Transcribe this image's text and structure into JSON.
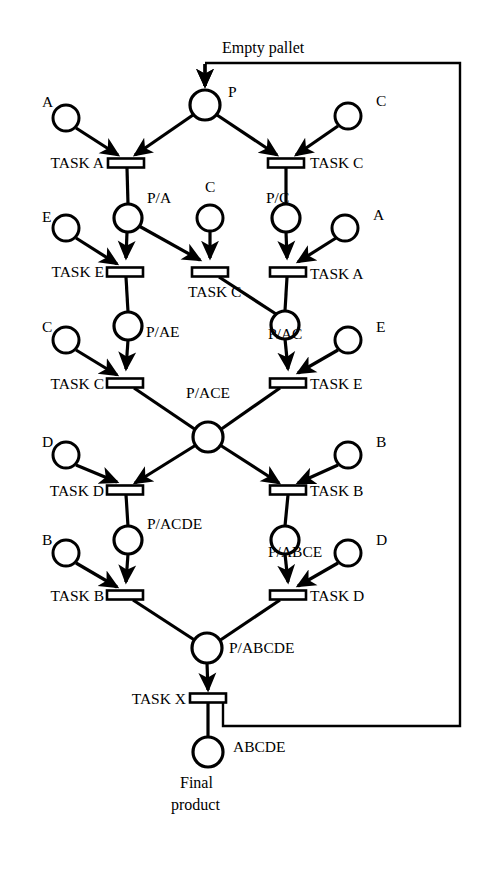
{
  "diagram": {
    "type": "petri-net",
    "canvas": {
      "width": 487,
      "height": 869
    },
    "colors": {
      "stroke": "#000000",
      "fill": "#ffffff",
      "background": "#ffffff"
    },
    "captions": {
      "empty_pallet": "Empty pallet",
      "final_product_line1": "Final",
      "final_product_line2": "product"
    },
    "places": [
      {
        "id": "p",
        "label": "P",
        "cx": 205,
        "cy": 105,
        "r": 15,
        "label_x": 228,
        "label_y": 97,
        "kind": "pallet"
      },
      {
        "id": "res_a_1",
        "label": "A",
        "cx": 66,
        "cy": 118,
        "r": 13,
        "label_x": 42,
        "label_y": 107,
        "kind": "resource"
      },
      {
        "id": "res_c_1",
        "label": "C",
        "cx": 348,
        "cy": 116,
        "r": 13,
        "label_x": 376,
        "label_y": 106,
        "kind": "resource"
      },
      {
        "id": "p_a",
        "label": "P/A",
        "cx": 128,
        "cy": 218,
        "r": 14,
        "label_x": 147,
        "label_y": 203,
        "kind": "pallet"
      },
      {
        "id": "res_c_2",
        "label": "C",
        "cx": 210,
        "cy": 218,
        "r": 13,
        "label_x": 205,
        "label_y": 192,
        "kind": "resource"
      },
      {
        "id": "p_c",
        "label": "P/C",
        "cx": 286,
        "cy": 218,
        "r": 14,
        "label_x": 266,
        "label_y": 203,
        "kind": "pallet"
      },
      {
        "id": "res_a_2",
        "label": "A",
        "cx": 345,
        "cy": 228,
        "r": 13,
        "label_x": 373,
        "label_y": 220,
        "kind": "resource"
      },
      {
        "id": "res_e_1",
        "label": "E",
        "cx": 66,
        "cy": 228,
        "r": 13,
        "label_x": 42,
        "label_y": 222,
        "kind": "resource"
      },
      {
        "id": "p_ae",
        "label": "P/AE",
        "cx": 128,
        "cy": 326,
        "r": 14,
        "label_x": 146,
        "label_y": 337,
        "kind": "pallet"
      },
      {
        "id": "p_ac",
        "label": "P/AC",
        "cx": 285,
        "cy": 325,
        "r": 14,
        "label_x": 268,
        "label_y": 339,
        "kind": "pallet"
      },
      {
        "id": "res_c_3",
        "label": "C",
        "cx": 66,
        "cy": 340,
        "r": 13,
        "label_x": 42,
        "label_y": 332,
        "kind": "resource"
      },
      {
        "id": "res_e_2",
        "label": "E",
        "cx": 348,
        "cy": 340,
        "r": 13,
        "label_x": 376,
        "label_y": 332,
        "kind": "resource"
      },
      {
        "id": "p_ace",
        "label": "P/ACE",
        "cx": 208,
        "cy": 437,
        "r": 15,
        "label_x": 208,
        "label_y": 398,
        "kind": "pallet"
      },
      {
        "id": "res_d_1",
        "label": "D",
        "cx": 66,
        "cy": 455,
        "r": 13,
        "label_x": 42,
        "label_y": 447,
        "kind": "resource"
      },
      {
        "id": "res_b_1",
        "label": "B",
        "cx": 348,
        "cy": 455,
        "r": 13,
        "label_x": 376,
        "label_y": 447,
        "kind": "resource"
      },
      {
        "id": "p_acde",
        "label": "P/ACDE",
        "cx": 128,
        "cy": 540,
        "r": 14,
        "label_x": 147,
        "label_y": 529,
        "kind": "pallet"
      },
      {
        "id": "p_abce",
        "label": "P/ABCE",
        "cx": 285,
        "cy": 540,
        "r": 14,
        "label_x": 268,
        "label_y": 557,
        "kind": "pallet"
      },
      {
        "id": "res_b_2",
        "label": "B",
        "cx": 66,
        "cy": 553,
        "r": 13,
        "label_x": 42,
        "label_y": 545,
        "kind": "resource"
      },
      {
        "id": "res_d_2",
        "label": "D",
        "cx": 348,
        "cy": 553,
        "r": 13,
        "label_x": 376,
        "label_y": 545,
        "kind": "resource"
      },
      {
        "id": "p_abcde",
        "label": "P/ABCDE",
        "cx": 207,
        "cy": 648,
        "r": 15,
        "label_x": 229,
        "label_y": 653,
        "kind": "pallet"
      },
      {
        "id": "abcde",
        "label": "ABCDE",
        "cx": 208,
        "cy": 752,
        "r": 15,
        "label_x": 233,
        "label_y": 752,
        "kind": "product"
      }
    ],
    "transitions": [
      {
        "id": "t_a_1",
        "label": "TASK A",
        "cx": 126,
        "cy": 163,
        "w": 36,
        "h": 9,
        "label_x": 104,
        "label_y": 168,
        "label_anchor": "end"
      },
      {
        "id": "t_c_1",
        "label": "TASK C",
        "cx": 286,
        "cy": 163,
        "w": 36,
        "h": 9,
        "label_x": 310,
        "label_y": 168,
        "label_anchor": "start"
      },
      {
        "id": "t_e_1",
        "label": "TASK E",
        "cx": 125,
        "cy": 272,
        "w": 36,
        "h": 9,
        "label_x": 104,
        "label_y": 277,
        "label_anchor": "end"
      },
      {
        "id": "t_c_2",
        "label": "TASK C",
        "cx": 210,
        "cy": 272,
        "w": 36,
        "h": 9,
        "label_x": 188,
        "label_y": 297,
        "label_anchor": "start"
      },
      {
        "id": "t_a_2",
        "label": "TASK A",
        "cx": 288,
        "cy": 272,
        "w": 36,
        "h": 9,
        "label_x": 310,
        "label_y": 279,
        "label_anchor": "start"
      },
      {
        "id": "t_c_3",
        "label": "TASK C",
        "cx": 125,
        "cy": 383,
        "w": 36,
        "h": 9,
        "label_x": 104,
        "label_y": 389,
        "label_anchor": "end"
      },
      {
        "id": "t_e_2",
        "label": "TASK E",
        "cx": 288,
        "cy": 383,
        "w": 36,
        "h": 9,
        "label_x": 310,
        "label_y": 389,
        "label_anchor": "start"
      },
      {
        "id": "t_d_1",
        "label": "TASK D",
        "cx": 125,
        "cy": 490,
        "w": 36,
        "h": 9,
        "label_x": 104,
        "label_y": 496,
        "label_anchor": "end"
      },
      {
        "id": "t_b_1",
        "label": "TASK B",
        "cx": 288,
        "cy": 490,
        "w": 36,
        "h": 9,
        "label_x": 310,
        "label_y": 496,
        "label_anchor": "start"
      },
      {
        "id": "t_b_2",
        "label": "TASK B",
        "cx": 125,
        "cy": 595,
        "w": 36,
        "h": 9,
        "label_x": 104,
        "label_y": 601,
        "label_anchor": "end"
      },
      {
        "id": "t_d_2",
        "label": "TASK D",
        "cx": 288,
        "cy": 595,
        "w": 36,
        "h": 9,
        "label_x": 310,
        "label_y": 601,
        "label_anchor": "start"
      },
      {
        "id": "t_x",
        "label": "TASK X",
        "cx": 208,
        "cy": 698,
        "w": 36,
        "h": 9,
        "label_x": 186,
        "label_y": 704,
        "label_anchor": "end"
      }
    ],
    "arcs": [
      {
        "from": "empty-pallet-feed",
        "to": "p",
        "path": "M 205 64 L 205 86",
        "arrow": true
      },
      {
        "from": "res_a_1",
        "to": "t_a_1",
        "path": "M 76 128 L 118 155",
        "arrow": true
      },
      {
        "from": "p",
        "to": "t_a_1",
        "path": "M 193 115 L 135 155",
        "arrow": true
      },
      {
        "from": "p",
        "to": "t_c_1",
        "path": "M 217 115 L 277 155",
        "arrow": true
      },
      {
        "from": "res_c_1",
        "to": "t_c_1",
        "path": "M 338 126 L 296 155",
        "arrow": true
      },
      {
        "from": "t_a_1",
        "to": "p_a",
        "path": "M 127 168 L 128 204",
        "arrow": false
      },
      {
        "from": "t_c_1",
        "to": "p_c",
        "path": "M 286 168 L 286 204",
        "arrow": false
      },
      {
        "from": "res_e_1",
        "to": "t_e_1",
        "path": "M 76 238 L 117 264",
        "arrow": true
      },
      {
        "from": "p_a",
        "to": "t_e_1",
        "path": "M 127 232 L 126 258",
        "arrow": true
      },
      {
        "from": "p_a",
        "to": "t_c_2",
        "path": "M 139 226 L 200 260",
        "arrow": true
      },
      {
        "from": "res_c_2",
        "to": "t_c_2",
        "path": "M 210 231 L 210 258",
        "arrow": true
      },
      {
        "from": "p_c",
        "to": "t_a_2",
        "path": "M 286 232 L 287 258",
        "arrow": true
      },
      {
        "from": "res_a_2",
        "to": "t_a_2",
        "path": "M 336 238 L 298 262",
        "arrow": true
      },
      {
        "from": "t_e_1",
        "to": "p_ae",
        "path": "M 126 277 L 128 312",
        "arrow": false
      },
      {
        "from": "t_c_2",
        "to": "p_ac",
        "path": "M 219 277 L 276 314",
        "arrow": false
      },
      {
        "from": "t_a_2",
        "to": "p_ac",
        "path": "M 287 277 L 285 311",
        "arrow": false
      },
      {
        "from": "res_c_3",
        "to": "t_c_3",
        "path": "M 76 350 L 117 375",
        "arrow": true
      },
      {
        "from": "p_ae",
        "to": "t_c_3",
        "path": "M 128 340 L 126 369",
        "arrow": true
      },
      {
        "from": "p_ac",
        "to": "t_e_2",
        "path": "M 285 339 L 288 369",
        "arrow": true
      },
      {
        "from": "res_e_2",
        "to": "t_e_2",
        "path": "M 338 350 L 298 373",
        "arrow": true
      },
      {
        "from": "t_c_3",
        "to": "p_ace",
        "path": "M 134 388 L 196 430",
        "arrow": false
      },
      {
        "from": "t_e_2",
        "to": "p_ace",
        "path": "M 280 388 L 220 430",
        "arrow": false
      },
      {
        "from": "res_d_1",
        "to": "t_d_1",
        "path": "M 76 465 L 117 482",
        "arrow": true
      },
      {
        "from": "p_ace",
        "to": "t_d_1",
        "path": "M 196 445 L 135 483",
        "arrow": true
      },
      {
        "from": "p_ace",
        "to": "t_b_1",
        "path": "M 220 445 L 279 483",
        "arrow": true
      },
      {
        "from": "res_b_1",
        "to": "t_b_1",
        "path": "M 338 465 L 298 483",
        "arrow": true
      },
      {
        "from": "t_d_1",
        "to": "p_acde",
        "path": "M 126 495 L 128 526",
        "arrow": false
      },
      {
        "from": "t_b_1",
        "to": "p_abce",
        "path": "M 288 495 L 285 526",
        "arrow": false
      },
      {
        "from": "res_b_2",
        "to": "t_b_2",
        "path": "M 76 563 L 117 587",
        "arrow": true
      },
      {
        "from": "p_acde",
        "to": "t_b_2",
        "path": "M 128 554 L 126 582",
        "arrow": true
      },
      {
        "from": "p_abce",
        "to": "t_d_2",
        "path": "M 285 554 L 288 582",
        "arrow": true
      },
      {
        "from": "res_d_2",
        "to": "t_d_2",
        "path": "M 338 563 L 298 586",
        "arrow": true
      },
      {
        "from": "t_b_2",
        "to": "p_abcde",
        "path": "M 133 600 L 196 641",
        "arrow": false
      },
      {
        "from": "t_d_2",
        "to": "p_abcde",
        "path": "M 280 600 L 219 641",
        "arrow": false
      },
      {
        "from": "p_abcde",
        "to": "t_x",
        "path": "M 207 663 L 208 690",
        "arrow": true
      },
      {
        "from": "t_x",
        "to": "abcde",
        "path": "M 208 703 L 208 737",
        "arrow": false
      }
    ],
    "feedback_loop": {
      "label": "Empty pallet",
      "label_x": 222,
      "label_y": 53,
      "path": "M 223 703 L 223 726 L 460 726 L 460 63 L 205 63",
      "underline": "M 205 63 L 460 63"
    }
  }
}
